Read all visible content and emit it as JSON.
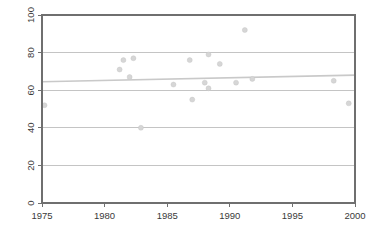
{
  "chart_data": {
    "type": "scatter",
    "title": "",
    "subtitle": "",
    "xlabel": "",
    "ylabel": "",
    "xlim": [
      1975,
      2000
    ],
    "ylim": [
      0,
      100
    ],
    "grid": "horizontal",
    "legend_position": "none",
    "xticks": [
      1975,
      1980,
      1985,
      1990,
      1995,
      2000
    ],
    "xtick_labels": [
      "1975",
      "1980",
      "1985",
      "1990",
      "1995",
      "2000"
    ],
    "yticks": [
      0,
      20,
      40,
      60,
      80,
      100
    ],
    "ytick_labels": [
      "0",
      "20",
      "40",
      "60",
      "80",
      "100"
    ],
    "ytick_label_rotation": -90,
    "points": [
      {
        "x": 1975.2,
        "y": 52
      },
      {
        "x": 1981.2,
        "y": 71
      },
      {
        "x": 1981.5,
        "y": 76
      },
      {
        "x": 1982.3,
        "y": 77
      },
      {
        "x": 1982.0,
        "y": 67
      },
      {
        "x": 1982.9,
        "y": 40
      },
      {
        "x": 1985.5,
        "y": 63
      },
      {
        "x": 1986.8,
        "y": 76
      },
      {
        "x": 1987.0,
        "y": 55
      },
      {
        "x": 1988.0,
        "y": 64
      },
      {
        "x": 1988.3,
        "y": 79
      },
      {
        "x": 1988.3,
        "y": 61
      },
      {
        "x": 1989.2,
        "y": 74
      },
      {
        "x": 1990.5,
        "y": 64
      },
      {
        "x": 1991.2,
        "y": 92
      },
      {
        "x": 1991.8,
        "y": 66
      },
      {
        "x": 1998.3,
        "y": 65
      },
      {
        "x": 1999.5,
        "y": 53
      }
    ],
    "series": [
      {
        "name": "observations",
        "type": "scatter",
        "marker": "circle",
        "color": "#d6d6d6",
        "x": [
          1975.2,
          1981.2,
          1981.5,
          1982.3,
          1982.0,
          1982.9,
          1985.5,
          1986.8,
          1987.0,
          1988.0,
          1988.3,
          1988.3,
          1989.2,
          1990.5,
          1991.2,
          1991.8,
          1998.3,
          1999.5
        ],
        "values": [
          52,
          71,
          76,
          77,
          67,
          40,
          63,
          76,
          55,
          64,
          79,
          61,
          74,
          64,
          92,
          66,
          65,
          53
        ]
      },
      {
        "name": "trend-line",
        "type": "line",
        "color": "#c9c9c9",
        "x": [
          1975,
          2000
        ],
        "values": [
          64.5,
          68.0
        ]
      }
    ],
    "trend_line": {
      "x_start": 1975,
      "y_start": 64.5,
      "x_end": 2000,
      "y_end": 68.0
    }
  },
  "axes": {
    "x_axis_name": "x-axis",
    "y_axis_name": "y-axis"
  }
}
